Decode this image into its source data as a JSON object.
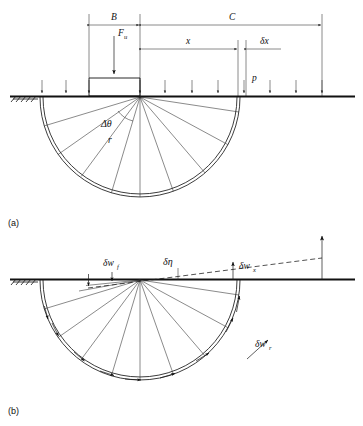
{
  "figure": {
    "background_color": "#ffffff",
    "line_color": "#1a1a1a",
    "panels": [
      {
        "id": "a",
        "label": "(a)",
        "caption": "Forces and geometry of circular slip mechanism"
      },
      {
        "id": "b",
        "label": "(b)",
        "caption": "Displacement diagram of circular slip mechanism"
      }
    ]
  },
  "panel_a": {
    "dimensions": [
      {
        "name": "B",
        "label": "B",
        "description": "footing width dimension"
      },
      {
        "name": "C",
        "label": "C",
        "description": "surcharge length dimension"
      },
      {
        "name": "x",
        "label": "x",
        "description": "distance to element"
      },
      {
        "name": "delta_x",
        "label": "δx",
        "description": "elemental width"
      }
    ],
    "loads": [
      {
        "name": "Fu",
        "label": "F",
        "subscript": "u",
        "description": "ultimate footing load"
      },
      {
        "name": "p",
        "label": "p",
        "description": "surcharge pressure"
      }
    ],
    "geometry": [
      {
        "name": "delta_theta",
        "label": "Δθ",
        "description": "angular increment of slip fan"
      },
      {
        "name": "r",
        "label": "r",
        "description": "slip circle radius"
      }
    ],
    "ground_label": "ground surface",
    "hatching_label": "fixed ground hatching"
  },
  "panel_b": {
    "velocities": [
      {
        "name": "delta_w_f",
        "label": "δw",
        "subscript": "f",
        "description": "footing displacement"
      },
      {
        "name": "delta_eta",
        "label": "δη",
        "description": "rotation angle increment"
      },
      {
        "name": "delta_w_x",
        "label": "δw",
        "subscript": "x",
        "description": "surface displacement at x"
      },
      {
        "name": "delta_w_r",
        "label": "δw",
        "subscript": "r",
        "description": "radial slip displacement"
      }
    ],
    "ground_label": "ground surface",
    "hatching_label": "fixed ground hatching"
  }
}
